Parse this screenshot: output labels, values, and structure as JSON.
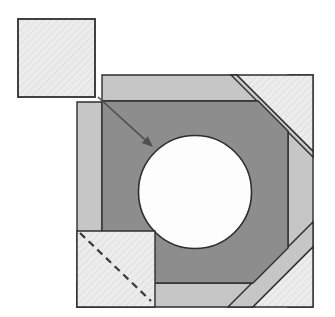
{
  "canvas": {
    "width": 335,
    "height": 317,
    "background": "#ffffff"
  },
  "colors": {
    "outline": "#2e2e2e",
    "band": "#c6c6c6",
    "dark": "#8d8d8d",
    "hatch_bg": "#ececec",
    "hatch_line": "#dbdbdb",
    "circle_fill": "#fdfdfd",
    "arrow": "#4f4f4f",
    "dash": "#3a3a3a"
  },
  "stroke_widths": {
    "piece": 1.4,
    "detached_square": 1.8,
    "circle": 1.6,
    "arrow_line": 1.6,
    "dash_line": 2.2
  },
  "pieces": [
    {
      "name": "right-band",
      "fill": "band",
      "points": [
        [
          288,
          75
        ],
        [
          313,
          75
        ],
        [
          313,
          307
        ],
        [
          288,
          307
        ]
      ]
    },
    {
      "name": "top-band",
      "fill": "band",
      "points": [
        [
          102,
          75
        ],
        [
          237,
          75
        ],
        [
          263,
          101
        ],
        [
          102,
          101
        ]
      ]
    },
    {
      "name": "bottom-band",
      "fill": "band",
      "points": [
        [
          77,
          283
        ],
        [
          277,
          283
        ],
        [
          253,
          307
        ],
        [
          77,
          307
        ]
      ]
    },
    {
      "name": "left-band",
      "fill": "band",
      "points": [
        [
          77,
          102
        ],
        [
          102,
          102
        ],
        [
          102,
          307
        ],
        [
          77,
          307
        ]
      ]
    },
    {
      "name": "top-right-seam-strip",
      "fill": "band",
      "points": [
        [
          231,
          75
        ],
        [
          237,
          75
        ],
        [
          313,
          151
        ],
        [
          313,
          157
        ]
      ]
    },
    {
      "name": "bottom-right-seam-strip",
      "fill": "band",
      "points": [
        [
          228,
          307
        ],
        [
          313,
          222
        ],
        [
          313,
          247
        ],
        [
          253,
          307
        ]
      ]
    },
    {
      "name": "dark-ring-octagon",
      "fill": "dark",
      "points": [
        [
          102,
          101
        ],
        [
          258,
          101
        ],
        [
          288,
          131
        ],
        [
          288,
          248
        ],
        [
          253,
          283
        ],
        [
          102,
          283
        ]
      ]
    }
  ],
  "overlays": [
    {
      "name": "top-right-corner-triangle",
      "fill": "hatch",
      "points": [
        [
          237,
          75
        ],
        [
          313,
          75
        ],
        [
          313,
          151
        ]
      ]
    },
    {
      "name": "bottom-right-corner-triangle",
      "fill": "hatch",
      "points": [
        [
          253,
          307
        ],
        [
          313,
          247
        ],
        [
          313,
          307
        ]
      ]
    },
    {
      "name": "bottom-left-corner-square",
      "fill": "hatch",
      "points": [
        [
          77,
          231
        ],
        [
          155,
          231
        ],
        [
          155,
          307
        ],
        [
          77,
          307
        ]
      ]
    }
  ],
  "circle": {
    "name": "center-circle",
    "cx": 195,
    "cy": 192,
    "r": 56.5
  },
  "detached_square": {
    "name": "detached-corner-square",
    "x": 18,
    "y": 19,
    "width": 77,
    "height": 78
  },
  "dashed_line": {
    "name": "fold-dashed-line",
    "x1": 80,
    "y1": 233,
    "x2": 151,
    "y2": 301,
    "dasharray": "7 5"
  },
  "arrow": {
    "name": "placement-arrow",
    "x1": 98,
    "y1": 97,
    "x2": 153,
    "y2": 147,
    "head_length": 11,
    "head_width": 9
  },
  "hatch_pattern": {
    "size": 5,
    "line_width": 1.5,
    "angle": 45
  }
}
